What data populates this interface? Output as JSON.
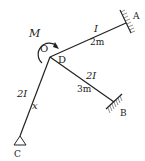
{
  "figure": {
    "type": "frame-structure",
    "joint": {
      "label_o": "O",
      "label_d": "D"
    },
    "moment": {
      "label": "M",
      "direction": "clockwise"
    },
    "members": [
      {
        "name": "OA",
        "stiffness": "I",
        "length": "2m"
      },
      {
        "name": "DB",
        "stiffness": "2I",
        "length": "3m"
      },
      {
        "name": "OC",
        "stiffness": "2I",
        "coordinate": "x"
      }
    ],
    "supports": [
      {
        "label": "A",
        "type": "fixed"
      },
      {
        "label": "B",
        "type": "fixed"
      },
      {
        "label": "C",
        "type": "pin"
      }
    ]
  },
  "colors": {
    "line": "#222222",
    "background": "#ffffff"
  }
}
